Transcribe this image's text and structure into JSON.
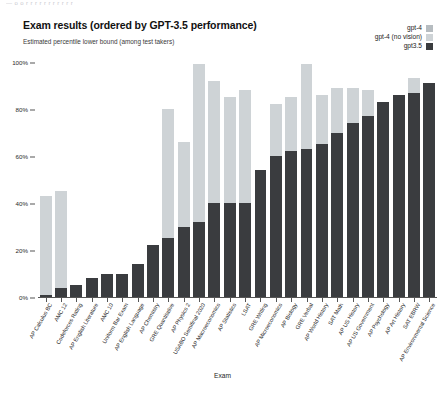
{
  "top_clipped_text": "— o o r r r r r r r r r r r",
  "title": "Exam results (ordered by GPT-3.5 performance)",
  "subtitle": "Estimated percentile lower bound (among test takers)",
  "legend": {
    "position": "top-right",
    "entries": [
      {
        "label": "gpt-4",
        "color": "#b6bcc0"
      },
      {
        "label": "gpt-4 (no vision)",
        "color": "#ced3d6"
      },
      {
        "label": "gpt3.5",
        "color": "#3a3c3f"
      }
    ]
  },
  "chart_data": {
    "type": "bar",
    "title": "Exam results (ordered by GPT-3.5 performance)",
    "subtitle": "Estimated percentile lower bound (among test takers)",
    "xlabel": "Exam",
    "ylabel": "",
    "ylim": [
      0,
      100
    ],
    "yticks": [
      "0%",
      "20%",
      "40%",
      "60%",
      "80%",
      "100%"
    ],
    "ytick_values": [
      0,
      20,
      40,
      60,
      80,
      100
    ],
    "grid": false,
    "legend_position": "upper right",
    "categories": [
      "AP Calculus BC",
      "AMC 12",
      "Codeforces Rating",
      "AP English Literature",
      "AMC 10",
      "Uniform Bar Exam",
      "AP English Language",
      "AP Chemistry",
      "GRE Quantitative",
      "AP Physics 2",
      "USABO Semifinal 2020",
      "AP Macroeconomics",
      "AP Statistics",
      "LSAT",
      "GRE Writing",
      "AP Microeconomics",
      "AP Biology",
      "GRE Verbal",
      "AP World History",
      "SAT Math",
      "AP US History",
      "AP US Government",
      "AP Psychology",
      "AP Art History",
      "SAT EBRW",
      "AP Environmental Science"
    ],
    "series": [
      {
        "name": "gpt-4",
        "color": "#b6bcc0",
        "values": [
          43,
          45,
          5,
          8,
          10,
          10,
          14,
          22,
          80,
          66,
          99,
          92,
          85,
          88,
          54,
          82,
          85,
          99,
          86,
          89,
          89,
          88,
          83,
          86,
          93,
          91
        ]
      },
      {
        "name": "gpt-4 (no vision)",
        "color": "#ced3d6",
        "values": [
          43,
          45,
          5,
          8,
          10,
          10,
          14,
          22,
          80,
          66,
          99,
          92,
          85,
          88,
          54,
          82,
          85,
          99,
          86,
          89,
          89,
          88,
          83,
          86,
          93,
          91
        ]
      },
      {
        "name": "gpt3.5",
        "color": "#3a3c3f",
        "values": [
          1,
          4,
          5,
          8,
          10,
          10,
          14,
          22,
          25,
          30,
          32,
          40,
          40,
          40,
          54,
          60,
          62,
          63,
          65,
          70,
          74,
          77,
          83,
          86,
          87,
          91
        ]
      }
    ]
  }
}
